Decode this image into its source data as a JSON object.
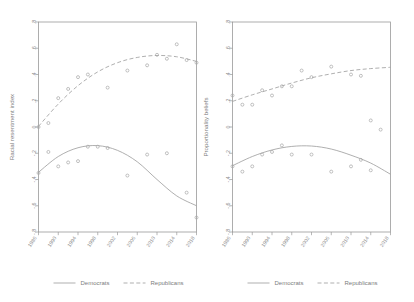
{
  "chart_data": [
    {
      "type": "scatter",
      "panel": "left",
      "title": "",
      "xlabel": "",
      "ylabel": "Racial resentment index",
      "ylim": [
        -0.8,
        0.8
      ],
      "xlim": [
        1986,
        2018
      ],
      "yticks": [
        0.8,
        0.6,
        0.4,
        0.2,
        0,
        -0.2,
        -0.4,
        -0.6,
        -0.8
      ],
      "ytick_labels": [
        ".8",
        ".6",
        ".4",
        ".2",
        "0",
        "-.2",
        "-.4",
        "-.6",
        "-.8"
      ],
      "xticks": [
        1986,
        1990,
        1994,
        1998,
        2002,
        2006,
        2010,
        2014,
        2018
      ],
      "xtick_labels": [
        "1986",
        "1990",
        "1994",
        "1998",
        "2002",
        "2006",
        "2010",
        "2014",
        "2018"
      ],
      "grid": false,
      "legend_position": "bottom",
      "series": [
        {
          "name": "Democrats",
          "style": "solid",
          "x": [
            1986,
            1988,
            1990,
            1992,
            1994,
            1996,
            1998,
            2000,
            2004,
            2008,
            2012,
            2016,
            2018
          ],
          "y": [
            -0.35,
            -0.19,
            -0.3,
            -0.27,
            -0.26,
            -0.15,
            -0.15,
            -0.16,
            -0.37,
            -0.21,
            -0.2,
            -0.5,
            -0.69
          ],
          "fit": {
            "type": "quadratic",
            "x": [
              1986,
              1990,
              1994,
              1998,
              2002,
              2006,
              2010,
              2014,
              2018
            ],
            "y": [
              -0.345,
              -0.225,
              -0.158,
              -0.142,
              -0.178,
              -0.265,
              -0.4,
              -0.525,
              -0.6
            ]
          }
        },
        {
          "name": "Republicans",
          "style": "dashed",
          "x": [
            1986,
            1988,
            1990,
            1992,
            1994,
            1996,
            2000,
            2004,
            2008,
            2010,
            2012,
            2014,
            2016,
            2018
          ],
          "y": [
            0.0,
            0.03,
            0.22,
            0.29,
            0.38,
            0.4,
            0.3,
            0.43,
            0.47,
            0.55,
            0.52,
            0.63,
            0.51,
            0.49
          ],
          "fit": {
            "type": "quadratic",
            "x": [
              1986,
              1990,
              1994,
              1998,
              2002,
              2006,
              2010,
              2014,
              2018
            ],
            "y": [
              0.005,
              0.175,
              0.315,
              0.42,
              0.49,
              0.53,
              0.545,
              0.535,
              0.5
            ]
          }
        }
      ]
    },
    {
      "type": "scatter",
      "panel": "right",
      "title": "",
      "xlabel": "",
      "ylabel": "Proportionality beliefs",
      "ylim": [
        -0.8,
        0.8
      ],
      "xlim": [
        1986,
        2018
      ],
      "yticks": [
        0.8,
        0.6,
        0.4,
        0.2,
        0,
        -0.2,
        -0.4,
        -0.6,
        -0.8
      ],
      "ytick_labels": [
        ".8",
        ".6",
        ".4",
        ".2",
        "0",
        "-.2",
        "-.4",
        "-.6",
        "-.8"
      ],
      "xticks": [
        1986,
        1990,
        1994,
        1998,
        2002,
        2006,
        2010,
        2014,
        2018
      ],
      "xtick_labels": [
        "1986",
        "1990",
        "1994",
        "1998",
        "2002",
        "2006",
        "2010",
        "2014",
        "2018"
      ],
      "grid": false,
      "legend_position": "bottom",
      "series": [
        {
          "name": "Democrats",
          "style": "solid",
          "x": [
            1986,
            1988,
            1990,
            1992,
            1994,
            1996,
            1998,
            2002,
            2006,
            2010,
            2012,
            2014
          ],
          "y": [
            -0.3,
            -0.34,
            -0.3,
            -0.21,
            -0.19,
            -0.14,
            -0.21,
            -0.21,
            -0.34,
            -0.3,
            -0.25,
            -0.33
          ],
          "fit": {
            "type": "quadratic",
            "x": [
              1986,
              1990,
              1994,
              1998,
              2002,
              2006,
              2010,
              2014,
              2018
            ],
            "y": [
              -0.295,
              -0.225,
              -0.175,
              -0.148,
              -0.145,
              -0.168,
              -0.215,
              -0.275,
              -0.36
            ]
          }
        },
        {
          "name": "Republicans",
          "style": "dashed",
          "x": [
            1986,
            1988,
            1990,
            1992,
            1994,
            1996,
            1998,
            2000,
            2002,
            2006,
            2010,
            2012,
            2014,
            2016
          ],
          "y": [
            0.24,
            0.17,
            0.17,
            0.28,
            0.24,
            0.31,
            0.31,
            0.43,
            0.38,
            0.46,
            0.4,
            0.39,
            0.05,
            -0.02
          ],
          "fit": {
            "type": "quadratic",
            "x": [
              1986,
              1990,
              1994,
              1998,
              2002,
              2006,
              2010,
              2014,
              2018
            ],
            "y": [
              0.195,
              0.245,
              0.29,
              0.335,
              0.375,
              0.405,
              0.43,
              0.445,
              0.455
            ]
          }
        }
      ]
    }
  ],
  "legend": {
    "items": [
      {
        "label": "Democrats",
        "style": "solid"
      },
      {
        "label": "Republicans",
        "style": "dashed"
      }
    ]
  },
  "colors": {
    "line": "#a0a0a0",
    "point": "#a6a6a6",
    "frame": "#9a9a9a",
    "text": "#8a8a8a",
    "background": "#ffffff"
  }
}
